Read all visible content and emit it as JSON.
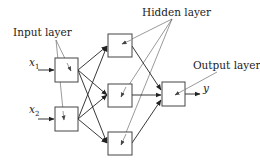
{
  "diagram": {
    "labels": {
      "input_layer": "Input layer",
      "hidden_layer": "Hidden layer",
      "output_layer": "Output layer"
    },
    "inputs": [
      {
        "var": "x",
        "sub": "1"
      },
      {
        "var": "x",
        "sub": "2"
      }
    ],
    "output": {
      "var": "y"
    },
    "layers": {
      "input_nodes": 2,
      "hidden_nodes": 3,
      "output_nodes": 1
    },
    "colors": {
      "stroke": "#444444",
      "text": "#222222",
      "background": "#ffffff"
    }
  }
}
